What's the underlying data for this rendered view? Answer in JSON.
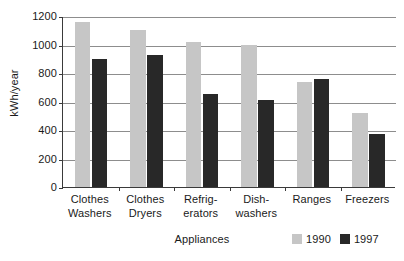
{
  "chart_data": {
    "type": "bar",
    "title": "",
    "xlabel": "Appliances",
    "ylabel": "kWh/year",
    "categories": [
      "Clothes\nWashers",
      "Clothes\nDryers",
      "Refrig-\nerators",
      "Dish-\nwashers",
      "Ranges",
      "Freezers"
    ],
    "category_lines": [
      [
        "Clothes",
        "Washers"
      ],
      [
        "Clothes",
        "Dryers"
      ],
      [
        "Refrig-",
        "erators"
      ],
      [
        "Dish-",
        "washers"
      ],
      [
        "Ranges",
        ""
      ],
      [
        "Freezers",
        ""
      ]
    ],
    "series": [
      {
        "name": "1990",
        "color": "#c6c6c6",
        "values": [
          1160,
          1100,
          1020,
          995,
          735,
          520
        ]
      },
      {
        "name": "1997",
        "color": "#282828",
        "values": [
          900,
          925,
          655,
          610,
          760,
          375
        ]
      }
    ],
    "ylim": [
      0,
      1200
    ],
    "ytick_labels": [
      "0",
      "200",
      "400",
      "600",
      "800",
      "1000",
      "1200"
    ],
    "ytick_values": [
      0,
      200,
      400,
      600,
      800,
      1000,
      1200
    ],
    "grid": true,
    "legend_position": "bottom-right"
  },
  "legend": {
    "entries": [
      {
        "label": "1990",
        "color": "#c6c6c6"
      },
      {
        "label": "1997",
        "color": "#282828"
      }
    ]
  }
}
